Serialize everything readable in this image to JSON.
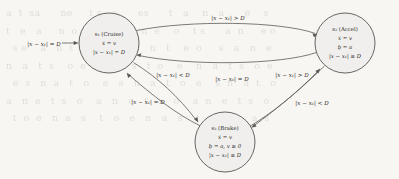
{
  "figure": {
    "kind": "hybrid-automaton-state-diagram",
    "page_background": "#f7f6f3",
    "node_fill": "#f0efed",
    "node_stroke": "#595650",
    "edge_stroke": "#5d5a55",
    "text_color": "#2e2c29",
    "bleed_through_text": "a  t  sa      ne     t s   a      es      t   a    n   a      e    s\nt   e   a     n  o     s  e    a   n  e    o    t s      a  n     e o\n  s e    a   n  t    o   e  s    a   n   t    e  o     s   a   n   e\nn   a   t  s    o  e   n    a   s   t  o    e    n   a   t  s   o  e\n  e  s   n  a   t   o    e   s   n   a   t   o   e    s  n   a  t   o\na   n  e   t  s   o    a   n   e   t   s   o    a  n   e   t  s   o\n  t  o  e   n  a   s    t   o   e   n   a   s    t  o   e  n   a  s"
  },
  "nodes": [
    {
      "id": "s1",
      "data_name": "state-node-cruise",
      "cx": 109,
      "cy": 43,
      "r": 30,
      "title": "s₁ (Cruise)",
      "lines": [
        "ẋ = v",
        "|x − x₁| = D"
      ]
    },
    {
      "id": "s2",
      "data_name": "state-node-accel",
      "cx": 345,
      "cy": 43,
      "r": 30,
      "title": "s₂ (Accel)",
      "lines": [
        "ẋ = v",
        "ḇ = a",
        "|x − x₁| ≥ D"
      ]
    },
    {
      "id": "s3",
      "data_name": "state-node-brake",
      "cx": 225,
      "cy": 142,
      "r": 30,
      "title": "s₃ (Brake)",
      "lines": [
        "ẋ = v",
        "ḇ = a, v ≥ 0",
        "|x − x₁| ≤ D"
      ]
    }
  ],
  "initial_transition": {
    "data_name": "initial-arrow-label",
    "label": "|x − x₁| = D",
    "target": "s1"
  },
  "transitions": [
    {
      "id": "t1",
      "data_name": "transition-cruise-to-accel",
      "from": "s1",
      "to": "s2",
      "label": "|x − x₁| > D"
    },
    {
      "id": "t2",
      "data_name": "transition-accel-to-cruise",
      "from": "s2",
      "to": "s1",
      "label": "|x − x₁| = D"
    },
    {
      "id": "t3",
      "data_name": "transition-cruise-to-brake",
      "from": "s1",
      "to": "s3",
      "label": "|x − x₁| < D"
    },
    {
      "id": "t4",
      "data_name": "transition-brake-to-cruise",
      "from": "s3",
      "to": "s1",
      "label": "|x − x₁| = D"
    },
    {
      "id": "t5",
      "data_name": "transition-brake-to-accel",
      "from": "s3",
      "to": "s2",
      "label": "|x − x₁| > D"
    },
    {
      "id": "t6",
      "data_name": "transition-accel-to-brake",
      "from": "s2",
      "to": "s3",
      "label": "|x − x₁| < D"
    }
  ],
  "edge_label_positions": {
    "t1": {
      "x": 228,
      "y": 20
    },
    "t2": {
      "x": 232,
      "y": 81
    },
    "t3": {
      "x": 173,
      "y": 77
    },
    "t4": {
      "x": 148,
      "y": 104
    },
    "t5": {
      "x": 292,
      "y": 77
    },
    "t6": {
      "x": 312,
      "y": 105
    },
    "initial": {
      "x": 44,
      "y": 46
    }
  }
}
